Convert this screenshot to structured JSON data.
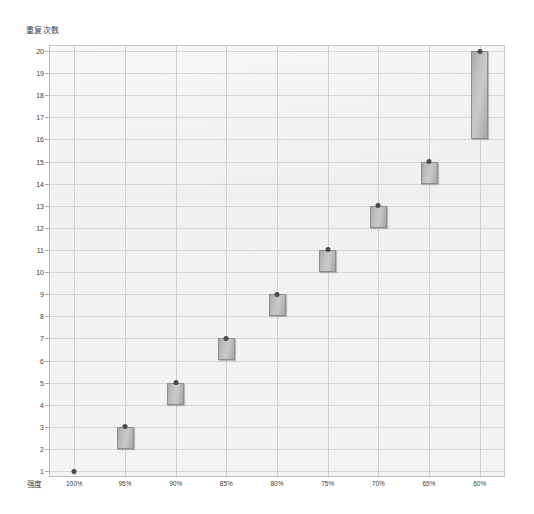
{
  "chart_data": {
    "type": "bar",
    "title": "",
    "subtitle": "",
    "ylabel": "重复次数",
    "xlabel": "强度",
    "categories": [
      "100%",
      "95%",
      "90%",
      "85%",
      "80%",
      "75%",
      "70%",
      "65%",
      "60%"
    ],
    "ytick_labels": [
      "1",
      "2",
      "3",
      "4",
      "5",
      "6",
      "7",
      "8",
      "9",
      "10",
      "11",
      "12",
      "13",
      "14",
      "15",
      "16",
      "17",
      "18",
      "19",
      "20"
    ],
    "ylim": [
      1,
      20
    ],
    "grid": true,
    "legend": null,
    "series": [
      {
        "name": "重复次数区间",
        "points": [
          {
            "x": "100%",
            "low": 1,
            "high": 1,
            "marker": 1
          },
          {
            "x": "95%",
            "low": 2,
            "high": 3,
            "marker": 3
          },
          {
            "x": "90%",
            "low": 4,
            "high": 5,
            "marker": 5
          },
          {
            "x": "85%",
            "low": 6,
            "high": 7,
            "marker": 7
          },
          {
            "x": "80%",
            "low": 8,
            "high": 9,
            "marker": 9
          },
          {
            "x": "75%",
            "low": 10,
            "high": 11,
            "marker": 11
          },
          {
            "x": "70%",
            "low": 12,
            "high": 13,
            "marker": 13
          },
          {
            "x": "65%",
            "low": 14,
            "high": 15,
            "marker": 15
          },
          {
            "x": "60%",
            "low": 16,
            "high": 20,
            "marker": 20
          }
        ]
      }
    ],
    "colors": {
      "plot_background": "#efefef",
      "gridline": "#d6d6d6",
      "axis": "#bdbdbd",
      "marker_fill": "#c0c0c0",
      "marker_border": "#8d8d8d",
      "marker_dot": "#4a4a4a",
      "text": "#3d3d3d"
    }
  }
}
